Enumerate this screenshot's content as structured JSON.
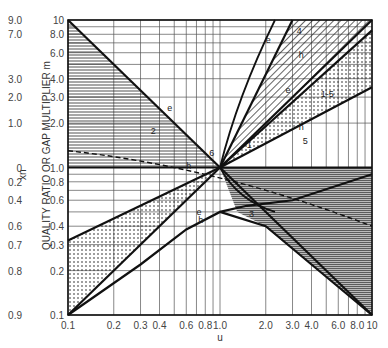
{
  "chart_data": {
    "type": "line",
    "title": "",
    "xlabel": "u",
    "ylabel": "QUALITY RATIO OR GAP MULTIPLIER m",
    "secondary_ylabel": "x_n",
    "x_scale": "log",
    "y_scale": "log",
    "xlim": [
      0.1,
      10
    ],
    "ylim": [
      0.1,
      10
    ],
    "x_ticks": [
      "0.1",
      "0.2",
      "0.3",
      "0.4",
      "0.6",
      "0.8",
      "1.0",
      "2.0",
      "3.0",
      "4.0",
      "6.0",
      "8.0",
      "10"
    ],
    "y_ticks": [
      "0.1",
      "0.2",
      "0.3",
      "0.4",
      "0.6",
      "0.8",
      "1.0",
      "2.0",
      "3.0",
      "4.0",
      "6.0",
      "8.0",
      "10"
    ],
    "secondary_y_ticks": [
      "0.9",
      "0.8",
      "0.7",
      "0.6",
      "0.4",
      "0.2",
      "0",
      "1.0",
      "2.0",
      "3.0",
      "7.0",
      "9.0"
    ],
    "grid": true,
    "legend": "none",
    "curve_labels": [
      "1",
      "1-5",
      "2",
      "3",
      "4",
      "5",
      "6",
      "e",
      "h"
    ],
    "series": [
      {
        "name": "e (region 2 upper)",
        "x": [
          0.1,
          1.0
        ],
        "y": [
          10,
          1.0
        ]
      },
      {
        "name": "e (region 3/lower right)",
        "x": [
          1.0,
          10
        ],
        "y": [
          1.0,
          0.1
        ]
      },
      {
        "name": "h (horizontal)",
        "x": [
          0.1,
          10
        ],
        "y": [
          1.0,
          1.0
        ]
      },
      {
        "name": "e (region 4 upper)",
        "x": [
          1.0,
          3.0
        ],
        "y": [
          1.0,
          10
        ]
      },
      {
        "name": "h (region 4 lower)",
        "x": [
          1.0,
          10
        ],
        "y": [
          1.0,
          10
        ]
      },
      {
        "name": "e (region 1-5 upper)",
        "x": [
          1.0,
          10
        ],
        "y": [
          1.0,
          8.5
        ]
      },
      {
        "name": "h (region 5 lower)",
        "x": [
          1.0,
          10
        ],
        "y": [
          1.0,
          3.5
        ]
      },
      {
        "name": "lower-left upper bound",
        "x": [
          0.1,
          1.0
        ],
        "y": [
          0.32,
          1.0
        ]
      },
      {
        "name": "lower-left diagonal",
        "x": [
          0.1,
          1.0
        ],
        "y": [
          0.1,
          1.0
        ]
      },
      {
        "name": "e/h lower band",
        "x": [
          0.1,
          0.3,
          0.6,
          1.0,
          1.5,
          3.0,
          10
        ],
        "y": [
          0.1,
          0.22,
          0.38,
          0.5,
          0.55,
          0.6,
          0.9
        ]
      },
      {
        "name": "lower-right curve",
        "x": [
          1.0,
          2.0,
          4.0,
          10
        ],
        "y": [
          0.5,
          0.4,
          0.22,
          0.1
        ]
      }
    ]
  },
  "labels": {
    "xlabel": "u",
    "ylabel": "QUALITY RATIO OR GAP MULTIPLIER",
    "ylabel_m": "m",
    "xn": "x",
    "xn_sub": "n"
  }
}
